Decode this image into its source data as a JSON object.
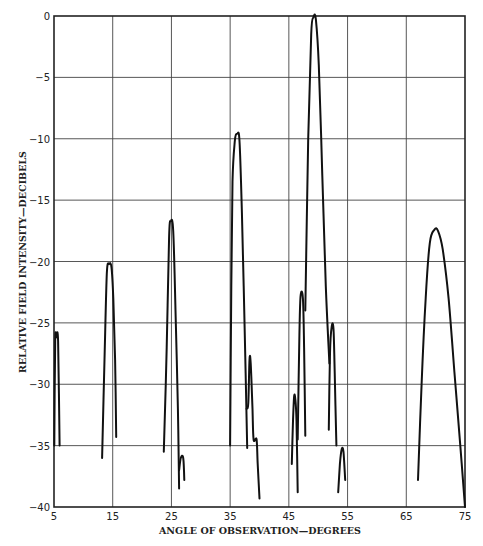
{
  "chart_data": {
    "type": "line",
    "title": "",
    "xlabel": "ANGLE OF OBSERVATION—DEGREES",
    "ylabel": "RELATIVE FIELD INTENSITY—DECIBELS",
    "xlim": [
      5,
      75
    ],
    "ylim": [
      -40,
      0
    ],
    "x_ticks": [
      5,
      15,
      25,
      35,
      45,
      55,
      65,
      75
    ],
    "y_ticks": [
      0,
      -5,
      -10,
      -15,
      -20,
      -25,
      -30,
      -35,
      -40
    ],
    "grid": true,
    "legend": null,
    "line_color": "#111111",
    "series": [
      {
        "name": "lobe-5",
        "points": [
          [
            5.05,
            -35
          ],
          [
            5.2,
            -26.5
          ],
          [
            5.4,
            -26.2
          ],
          [
            5.7,
            -26.5
          ],
          [
            5.95,
            -35
          ]
        ]
      },
      {
        "name": "lobe-14",
        "points": [
          [
            13.2,
            -36
          ],
          [
            13.6,
            -28
          ],
          [
            14.0,
            -21
          ],
          [
            14.4,
            -20.2
          ],
          [
            14.8,
            -20.5
          ],
          [
            15.1,
            -23
          ],
          [
            15.4,
            -28
          ],
          [
            15.6,
            -34.3
          ]
        ]
      },
      {
        "name": "lobe-25",
        "points": [
          [
            23.7,
            -35.5
          ],
          [
            24.2,
            -27
          ],
          [
            24.6,
            -18
          ],
          [
            24.9,
            -16.7
          ],
          [
            25.3,
            -17.5
          ],
          [
            25.7,
            -24
          ],
          [
            26.1,
            -32
          ],
          [
            26.3,
            -38.5
          ]
        ]
      },
      {
        "name": "lobe-26-small",
        "points": [
          [
            26.3,
            -37
          ],
          [
            26.6,
            -36
          ],
          [
            27.0,
            -36
          ],
          [
            27.2,
            -37.8
          ]
        ]
      },
      {
        "name": "lobe-36",
        "points": [
          [
            35.0,
            -35
          ],
          [
            35.2,
            -22
          ],
          [
            35.4,
            -13.5
          ],
          [
            35.8,
            -10.2
          ],
          [
            36.2,
            -9.6
          ],
          [
            36.6,
            -10.2
          ],
          [
            37.0,
            -16
          ],
          [
            37.5,
            -26
          ],
          [
            37.9,
            -35.2
          ]
        ]
      },
      {
        "name": "lobe-38",
        "points": [
          [
            37.8,
            -32
          ],
          [
            38.1,
            -31.5
          ],
          [
            38.3,
            -28
          ],
          [
            38.5,
            -28.3
          ],
          [
            38.8,
            -32
          ],
          [
            39.0,
            -34.5
          ],
          [
            39.5,
            -34.5
          ],
          [
            39.7,
            -36.5
          ],
          [
            40.0,
            -39.3
          ]
        ]
      },
      {
        "name": "lobe-46a",
        "points": [
          [
            45.5,
            -36.5
          ],
          [
            45.7,
            -33
          ],
          [
            45.9,
            -31
          ],
          [
            46.1,
            -31.2
          ],
          [
            46.3,
            -33
          ],
          [
            46.5,
            -38.8
          ]
        ]
      },
      {
        "name": "lobe-47",
        "points": [
          [
            46.5,
            -34.5
          ],
          [
            46.8,
            -26
          ],
          [
            47.0,
            -22.8
          ],
          [
            47.4,
            -23
          ],
          [
            47.6,
            -27
          ],
          [
            47.8,
            -34.2
          ]
        ]
      },
      {
        "name": "lobe-49",
        "points": [
          [
            47.8,
            -24
          ],
          [
            48.3,
            -10
          ],
          [
            48.8,
            -1.5
          ],
          [
            49.2,
            -0.1
          ],
          [
            49.6,
            -0.3
          ],
          [
            50.1,
            -4
          ],
          [
            50.7,
            -13
          ],
          [
            51.3,
            -22
          ],
          [
            51.9,
            -28.3
          ]
        ]
      },
      {
        "name": "lobe-52",
        "points": [
          [
            51.8,
            -33.7
          ],
          [
            52.0,
            -27.5
          ],
          [
            52.3,
            -25.3
          ],
          [
            52.6,
            -25.5
          ],
          [
            52.8,
            -29
          ],
          [
            53.1,
            -35
          ]
        ]
      },
      {
        "name": "lobe-54",
        "points": [
          [
            53.4,
            -38.8
          ],
          [
            53.7,
            -36.5
          ],
          [
            54.0,
            -35.3
          ],
          [
            54.3,
            -35.5
          ],
          [
            54.6,
            -37.8
          ]
        ]
      },
      {
        "name": "lobe-70",
        "points": [
          [
            67.0,
            -37.8
          ],
          [
            67.6,
            -30
          ],
          [
            68.3,
            -23
          ],
          [
            69.0,
            -18.5
          ],
          [
            69.8,
            -17.4
          ],
          [
            70.4,
            -17.5
          ],
          [
            71.2,
            -19
          ],
          [
            72.2,
            -23
          ],
          [
            73.2,
            -29
          ],
          [
            74.2,
            -35
          ],
          [
            75.0,
            -40
          ]
        ]
      }
    ]
  }
}
